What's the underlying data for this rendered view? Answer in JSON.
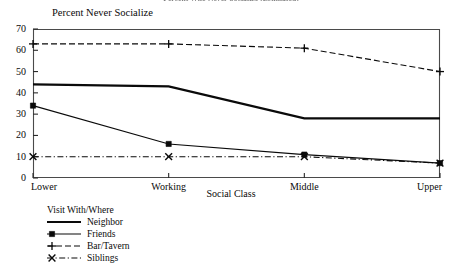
{
  "top_title_partial": "Percent Who Never Socialize (Estimated)",
  "axes": {
    "ytitle": "Percent Never Socialize",
    "xtitle": "Social Class",
    "yticks": [
      "0",
      "10",
      "20",
      "30",
      "40",
      "50",
      "60",
      "70"
    ],
    "xticks": [
      "Lower",
      "Working",
      "Middle",
      "Upper"
    ]
  },
  "legend": {
    "title": "Visit With/Where",
    "items": [
      {
        "label": "Neighbor",
        "style": "solid-thick",
        "marker": "none"
      },
      {
        "label": "Friends",
        "style": "solid-thin",
        "marker": "square"
      },
      {
        "label": "Bar/Tavern",
        "style": "dashed",
        "marker": "plus"
      },
      {
        "label": "Siblings",
        "style": "dash-dot",
        "marker": "cross"
      }
    ]
  },
  "chart_data": {
    "type": "line",
    "title": "Percent Who Never Socialize (Estimated)",
    "xlabel": "Social Class",
    "ylabel": "Percent Never Socialize",
    "categories": [
      "Lower",
      "Working",
      "Middle",
      "Upper"
    ],
    "ylim": [
      0,
      70
    ],
    "ytick_step": 10,
    "grid": false,
    "legend_position": "below-left",
    "legend_title": "Visit With/Where",
    "series": [
      {
        "name": "Neighbor",
        "values": [
          44,
          43,
          28,
          28
        ],
        "line": "solid",
        "width": 2.2,
        "marker": "none",
        "color": "#0a0a0a"
      },
      {
        "name": "Friends",
        "values": [
          34,
          16,
          11,
          7
        ],
        "line": "solid",
        "width": 1.1,
        "marker": "square",
        "color": "#0a0a0a"
      },
      {
        "name": "Bar/Tavern",
        "values": [
          63,
          63,
          61,
          50
        ],
        "line": "dashed",
        "width": 1.1,
        "marker": "plus",
        "color": "#0a0a0a"
      },
      {
        "name": "Siblings",
        "values": [
          10,
          10,
          10,
          7
        ],
        "line": "dash-dot",
        "width": 1.1,
        "marker": "cross",
        "color": "#0a0a0a"
      }
    ]
  }
}
